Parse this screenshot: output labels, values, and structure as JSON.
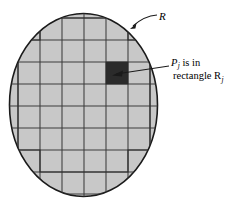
{
  "figure": {
    "region_label": "R",
    "callout": {
      "line1_text": "P",
      "line1_sub": "j",
      "line1_rest": " is in",
      "line2_text": "rectangle R",
      "line2_sub": "j"
    },
    "colors": {
      "region_fill": "#c8c8c8",
      "region_stroke": "#1a1a1a",
      "grid_stroke": "#3c3c3c",
      "highlight_fill": "#2b2b2b",
      "leader_stroke": "#1a1a1a",
      "background": "#ffffff"
    },
    "geometry": {
      "ellipse_cx": 83.5,
      "ellipse_cy": 105,
      "ellipse_rx": 74.5,
      "ellipse_ry": 92,
      "grid_step_x": 22,
      "grid_step_y": 22,
      "grid_origin_x": 18,
      "grid_origin_y": 18,
      "highlight_col": 4,
      "highlight_row": 3
    },
    "vertical_grid_lines_x": [
      18,
      40,
      62,
      84,
      106,
      128,
      150
    ],
    "horizontal_grid_lines_y": [
      18,
      40,
      62,
      84,
      106,
      128,
      150,
      172,
      194
    ]
  }
}
